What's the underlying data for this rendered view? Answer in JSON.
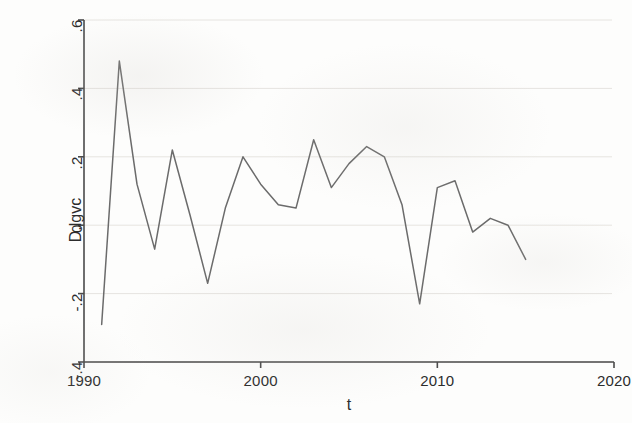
{
  "chart_data": {
    "type": "line",
    "title": "",
    "subtitle": "",
    "xlabel": "t",
    "ylabel": "D.lgvc",
    "xlim": [
      1990,
      2020
    ],
    "ylim": [
      -0.4,
      0.6
    ],
    "grid": true,
    "grid_axis": "y",
    "legend": "none",
    "xticks": [
      "1990",
      "2000",
      "2010",
      "2020"
    ],
    "xtick_values": [
      1990,
      2000,
      2010,
      2020
    ],
    "yticks": [
      "-.4",
      "-.2",
      "0",
      ".2",
      ".4",
      ".6"
    ],
    "ytick_values": [
      -0.4,
      -0.2,
      0,
      0.2,
      0.4,
      0.6
    ],
    "series": [
      {
        "name": "D.lgvc",
        "color": "#6b6b6b",
        "x": [
          1991,
          1992,
          1993,
          1994,
          1995,
          1996,
          1997,
          1998,
          1999,
          2000,
          2001,
          2002,
          2003,
          2004,
          2005,
          2006,
          2007,
          2008,
          2009,
          2010,
          2011,
          2012,
          2013,
          2014,
          2015
        ],
        "values": [
          -0.29,
          0.48,
          0.12,
          -0.07,
          0.22,
          0.03,
          -0.17,
          0.05,
          0.2,
          0.12,
          0.06,
          0.05,
          0.25,
          0.11,
          0.18,
          0.23,
          0.2,
          0.06,
          -0.23,
          0.11,
          0.13,
          -0.02,
          0.02,
          0.0,
          -0.1
        ]
      }
    ]
  },
  "axes": {
    "y_title": "D.lgvc",
    "x_title": "t"
  },
  "colors": {
    "line": "#6b6b6b",
    "axis": "#4a4a4a",
    "grid": "#e6e4e0",
    "text": "#2c2c2c",
    "background": "#fdfdfc"
  }
}
